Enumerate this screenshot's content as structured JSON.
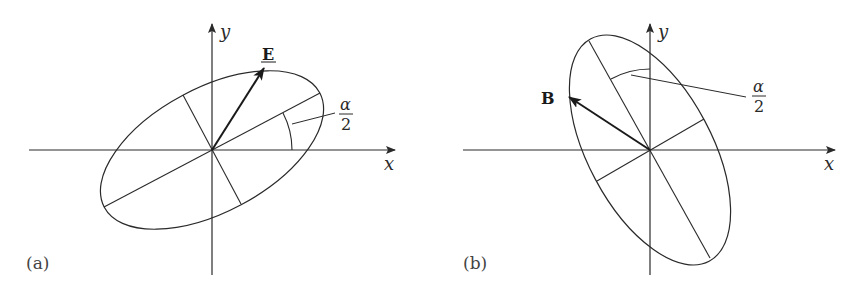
{
  "colors": {
    "stroke": "#2a2a2a",
    "background": "#ffffff"
  },
  "panels": [
    {
      "label": "(a)",
      "x_axis_label": "x",
      "y_axis_label": "y",
      "vector_label": "E",
      "angle_label_numerator": "α",
      "angle_label_denominator": "2",
      "ellipse_tilt_deg": 28
    },
    {
      "label": "(b)",
      "x_axis_label": "x",
      "y_axis_label": "y",
      "vector_label": "B",
      "angle_label_numerator": "α",
      "angle_label_denominator": "2",
      "ellipse_tilt_deg": -62
    }
  ]
}
